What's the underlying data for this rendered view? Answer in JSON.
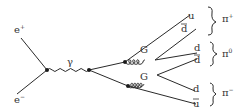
{
  "diagram": {
    "type": "feynman",
    "particles": {
      "positron": "e",
      "positron_sup": "+",
      "electron": "e",
      "electron_sup": "−",
      "photon": "γ",
      "gluon_upper": "G",
      "gluon_lower": "G",
      "quark_u": "u",
      "quark_dbar_upper": "d",
      "quark_d_middle": "d",
      "quark_dbar_middle": "d",
      "quark_d_lower": "d",
      "quark_ubar": "u"
    },
    "mesons": {
      "pi_plus": "π",
      "pi_plus_sup": "+",
      "pi_zero": "π",
      "pi_zero_sup": "0",
      "pi_minus": "π",
      "pi_minus_sup": "−"
    },
    "colors": {
      "line": "#2a2a2a",
      "text": "#333333",
      "background": "#ffffff"
    }
  }
}
